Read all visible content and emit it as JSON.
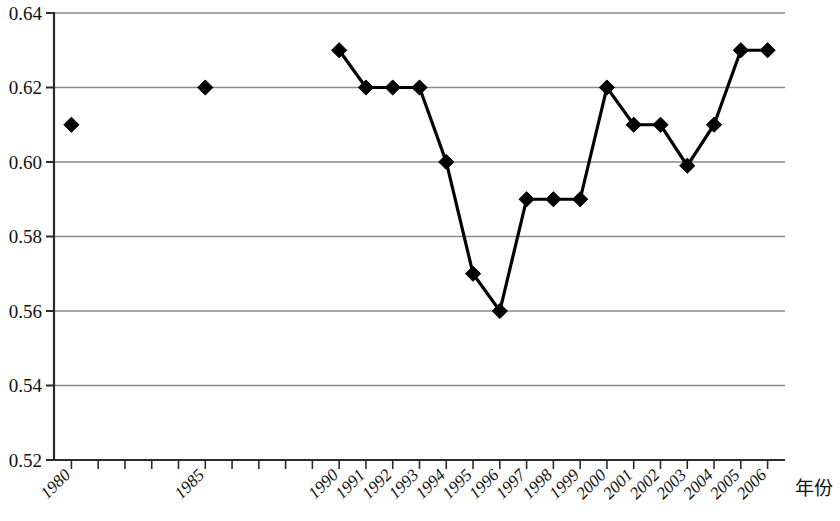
{
  "chart_data": {
    "type": "line",
    "title": "",
    "subtitle": "",
    "xlabel": "年份",
    "ylabel": "",
    "xlim": [
      1979.35,
      2006.65
    ],
    "ylim": [
      0.52,
      0.64
    ],
    "grid": true,
    "legend": "none",
    "marker": "diamond",
    "x_tick_labels_rotated": true,
    "y_ticks": [
      0.52,
      0.54,
      0.56,
      0.58,
      0.6,
      0.62,
      0.64
    ],
    "y_tick_labels": [
      "0.52",
      "0.54",
      "0.56",
      "0.58",
      "0.60",
      "0.62",
      "0.64"
    ],
    "x_ticks": [
      1980,
      1981,
      1982,
      1983,
      1984,
      1985,
      1986,
      1987,
      1988,
      1989,
      1990,
      1991,
      1992,
      1993,
      1994,
      1995,
      1996,
      1997,
      1998,
      1999,
      2000,
      2001,
      2002,
      2003,
      2004,
      2005,
      2006
    ],
    "x_tick_labels": [
      "1980",
      "",
      "",
      "",
      "",
      "1985",
      "",
      "",
      "",
      "",
      "1990",
      "1991",
      "1992",
      "1993",
      "1994",
      "1995",
      "1996",
      "1997",
      "1998",
      "1999",
      "2000",
      "2001",
      "2002",
      "2003",
      "2004",
      "2005",
      "2006"
    ],
    "categories": [
      1980,
      1985,
      1990,
      1991,
      1992,
      1993,
      1994,
      1995,
      1996,
      1997,
      1998,
      1999,
      2000,
      2001,
      2002,
      2003,
      2004,
      2005,
      2006
    ],
    "values": [
      0.61,
      0.62,
      0.63,
      0.62,
      0.62,
      0.62,
      0.6,
      0.57,
      0.56,
      0.59,
      0.59,
      0.59,
      0.62,
      0.61,
      0.61,
      0.599,
      0.61,
      0.63,
      0.63
    ],
    "connected_from_year": 1990,
    "isolated_points": [
      {
        "x": 1980,
        "y": 0.61
      },
      {
        "x": 1985,
        "y": 0.62
      }
    ],
    "series": [
      {
        "name": "",
        "points": [
          {
            "x": 1980,
            "y": 0.61,
            "connected": false
          },
          {
            "x": 1985,
            "y": 0.62,
            "connected": false
          },
          {
            "x": 1990,
            "y": 0.63,
            "connected": true
          },
          {
            "x": 1991,
            "y": 0.62,
            "connected": true
          },
          {
            "x": 1992,
            "y": 0.62,
            "connected": true
          },
          {
            "x": 1993,
            "y": 0.62,
            "connected": true
          },
          {
            "x": 1994,
            "y": 0.6,
            "connected": true
          },
          {
            "x": 1995,
            "y": 0.57,
            "connected": true
          },
          {
            "x": 1996,
            "y": 0.56,
            "connected": true
          },
          {
            "x": 1997,
            "y": 0.59,
            "connected": true
          },
          {
            "x": 1998,
            "y": 0.59,
            "connected": true
          },
          {
            "x": 1999,
            "y": 0.59,
            "connected": true
          },
          {
            "x": 2000,
            "y": 0.62,
            "connected": true
          },
          {
            "x": 2001,
            "y": 0.61,
            "connected": true
          },
          {
            "x": 2002,
            "y": 0.61,
            "connected": true
          },
          {
            "x": 2003,
            "y": 0.599,
            "connected": true
          },
          {
            "x": 2004,
            "y": 0.61,
            "connected": true
          },
          {
            "x": 2005,
            "y": 0.63,
            "connected": true
          },
          {
            "x": 2006,
            "y": 0.63,
            "connected": true
          }
        ]
      }
    ],
    "colors": {
      "series": "#000000",
      "grid": "#8a8a8a",
      "axis": "#2b2b2b",
      "background": "#ffffff",
      "text": "#111111"
    }
  }
}
